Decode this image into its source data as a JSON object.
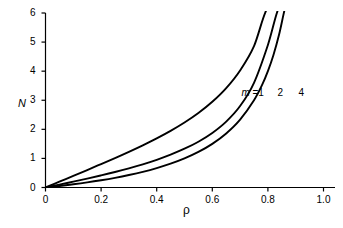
{
  "chart_data": {
    "type": "line",
    "title": "",
    "subtitle": "",
    "xlabel": "ρ",
    "ylabel": "N",
    "xlim": [
      0,
      1.05
    ],
    "ylim": [
      0,
      6.2
    ],
    "xticks": [
      0,
      0.2,
      0.4,
      0.6,
      0.8,
      1.0
    ],
    "xticklabels": [
      "0",
      "0.2",
      "0.4",
      "0.6",
      "0.8",
      "1.0"
    ],
    "yticks": [
      0,
      1,
      2,
      3,
      4,
      5,
      6
    ],
    "yticklabels": [
      "0",
      "1",
      "2",
      "3",
      "4",
      "5",
      "6"
    ],
    "grid": false,
    "legend_position": "inline-annotations",
    "line_color": "#000000",
    "axis_color": "#000000",
    "background_color": "#ffffff",
    "annotations": [
      {
        "text_prefix": "m",
        "text_suffix": " =1",
        "x": 0.755,
        "y": 3.25
      },
      {
        "text_prefix": "",
        "text_suffix": "2",
        "x": 0.885,
        "y": 3.25
      },
      {
        "text_prefix": "",
        "text_suffix": "4",
        "x": 0.96,
        "y": 3.25
      }
    ],
    "series": [
      {
        "name": "m = 1",
        "label": "m =1",
        "x": [
          0.0,
          0.05,
          0.1,
          0.15,
          0.2,
          0.25,
          0.3,
          0.35,
          0.4,
          0.45,
          0.5,
          0.55,
          0.6,
          0.65,
          0.7,
          0.75,
          0.78,
          0.8,
          0.82,
          0.84,
          0.855,
          0.862
        ],
        "values": [
          0.0,
          0.053,
          0.111,
          0.176,
          0.25,
          0.333,
          0.429,
          0.538,
          0.667,
          0.818,
          1.0,
          1.222,
          1.5,
          1.857,
          2.333,
          3.0,
          3.545,
          4.0,
          4.556,
          5.25,
          5.9,
          6.2
        ]
      },
      {
        "name": "m = 2",
        "label": "2",
        "x": [
          0.0,
          0.05,
          0.1,
          0.15,
          0.2,
          0.25,
          0.3,
          0.35,
          0.4,
          0.45,
          0.5,
          0.55,
          0.6,
          0.65,
          0.7,
          0.75,
          0.8,
          0.84,
          0.87,
          0.89,
          0.905,
          0.915
        ],
        "values": [
          0.0,
          0.1,
          0.202,
          0.307,
          0.417,
          0.533,
          0.659,
          0.797,
          0.952,
          1.13,
          1.333,
          1.574,
          1.875,
          2.265,
          2.8,
          3.6,
          4.9,
          6.2,
          6.2,
          6.2,
          6.2,
          6.2
        ]
      },
      {
        "name": "m = 4",
        "label": "4",
        "x": [
          0.0,
          0.05,
          0.1,
          0.15,
          0.2,
          0.25,
          0.3,
          0.35,
          0.4,
          0.45,
          0.5,
          0.55,
          0.6,
          0.65,
          0.7,
          0.75,
          0.8,
          0.85,
          0.88,
          0.91,
          0.93,
          0.945
        ],
        "values": [
          0.0,
          0.2,
          0.4,
          0.601,
          0.805,
          1.012,
          1.226,
          1.45,
          1.689,
          1.948,
          2.235,
          2.562,
          2.947,
          3.418,
          4.026,
          4.862,
          6.2,
          6.2,
          6.2,
          6.2,
          6.2,
          6.2
        ]
      }
    ]
  },
  "figure": {
    "axis_label_y": "N",
    "axis_label_x": "ρ"
  }
}
